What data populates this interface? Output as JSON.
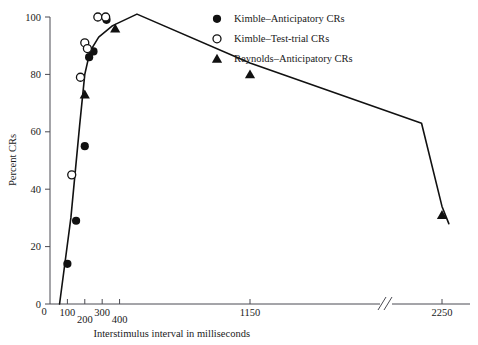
{
  "chart_data": {
    "type": "scatter",
    "title": "",
    "xlabel": "Interstimulus interval in milliseconds",
    "ylabel": "Percent CRs",
    "xticks": [
      "0",
      "100",
      "200",
      "300",
      "400",
      "1150",
      "2250"
    ],
    "xtick_values": [
      0,
      100,
      200,
      300,
      400,
      1150,
      2250
    ],
    "yticks": [
      "0",
      "20",
      "40",
      "60",
      "80",
      "100"
    ],
    "ytick_values": [
      0,
      20,
      40,
      60,
      80,
      100
    ],
    "ylim": [
      0,
      100
    ],
    "grid": false,
    "axis_break": true,
    "axis_break_between": [
      1150,
      2250
    ],
    "legend_position": "top-right",
    "series": [
      {
        "name": "Kimble–Anticipatory CRs",
        "marker": "filled-circle",
        "color": "#111111",
        "points": [
          {
            "x": 100,
            "y": 14
          },
          {
            "x": 150,
            "y": 29
          },
          {
            "x": 200,
            "y": 55
          },
          {
            "x": 225,
            "y": 86
          },
          {
            "x": 250,
            "y": 88
          },
          {
            "x": 325,
            "y": 99
          }
        ]
      },
      {
        "name": "Kimble–Test-trial CRs",
        "marker": "open-circle",
        "color": "#111111",
        "points": [
          {
            "x": 125,
            "y": 45
          },
          {
            "x": 175,
            "y": 79
          },
          {
            "x": 200,
            "y": 91
          },
          {
            "x": 215,
            "y": 89
          },
          {
            "x": 275,
            "y": 100
          },
          {
            "x": 320,
            "y": 100
          }
        ]
      },
      {
        "name": "Reynolds–Anticipatory CRs",
        "marker": "filled-triangle",
        "color": "#111111",
        "points": [
          {
            "x": 200,
            "y": 73
          },
          {
            "x": 375,
            "y": 96
          },
          {
            "x": 1150,
            "y": 80
          },
          {
            "x": 2250,
            "y": 31
          }
        ]
      }
    ],
    "fitted_curve": {
      "name": "fitted-trend-curve",
      "points": [
        {
          "x": 55,
          "y": 0
        },
        {
          "x": 120,
          "y": 30
        },
        {
          "x": 170,
          "y": 62
        },
        {
          "x": 200,
          "y": 80
        },
        {
          "x": 230,
          "y": 88
        },
        {
          "x": 280,
          "y": 93
        },
        {
          "x": 360,
          "y": 97
        },
        {
          "x": 500,
          "y": 101
        },
        {
          "x": 1150,
          "y": 84
        },
        {
          "x": 1800,
          "y": 63
        },
        {
          "x": 2250,
          "y": 34
        },
        {
          "x": 2400,
          "y": 28
        }
      ]
    }
  },
  "legend": {
    "items": [
      {
        "label": "Kimble–Anticipatory CRs",
        "marker": "filled-circle"
      },
      {
        "label": "Kimble–Test-trial CRs",
        "marker": "open-circle"
      },
      {
        "label": "Reynolds–Anticipatory CRs",
        "marker": "filled-triangle"
      }
    ]
  }
}
